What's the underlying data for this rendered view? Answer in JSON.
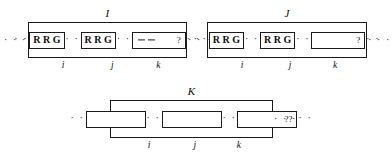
{
  "figure": {
    "ellipsis": "· · ·",
    "ellipsis_short": "· ·",
    "groups": [
      {
        "id": "I",
        "label": "I",
        "cells": [
          {
            "index": "i",
            "type": "rrg",
            "glyphs": [
              "R",
              "R",
              "G"
            ]
          },
          {
            "index": "j",
            "type": "rrg",
            "glyphs": [
              "R",
              "R",
              "G"
            ]
          },
          {
            "index": "k",
            "type": "dashed-unknown",
            "dashes": 2,
            "mark": "?"
          }
        ]
      },
      {
        "id": "J",
        "label": "J",
        "cells": [
          {
            "index": "i",
            "type": "rrg",
            "glyphs": [
              "R",
              "R",
              "G"
            ]
          },
          {
            "index": "j",
            "type": "rrg",
            "glyphs": [
              "R",
              "R",
              "G"
            ]
          },
          {
            "index": "k",
            "type": "blank-unknown",
            "mark": "?"
          }
        ]
      },
      {
        "id": "K",
        "label": "K",
        "cells": [
          {
            "index": "i",
            "type": "blank",
            "mark": ""
          },
          {
            "index": "j",
            "type": "blank",
            "mark": ""
          },
          {
            "index": "k",
            "type": "blank-unknown-double",
            "mark": "??"
          }
        ]
      }
    ]
  }
}
